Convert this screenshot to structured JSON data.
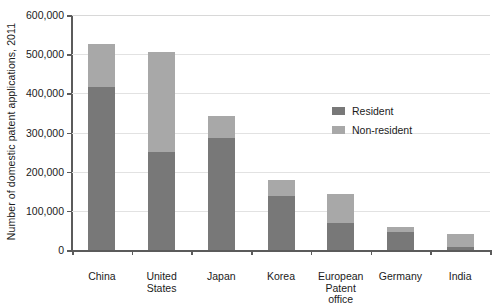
{
  "chart_data": {
    "type": "bar",
    "subtype": "stacked-bar",
    "title": "",
    "xlabel": "",
    "ylabel": "Number of domestic patent applications, 2011",
    "categories": [
      "China",
      "United\nStates",
      "Japan",
      "Korea",
      "European\nPatent\noffice",
      "Germany",
      "India"
    ],
    "series": [
      {
        "name": "Resident",
        "color": "#787878",
        "values": [
          415000,
          250000,
          287000,
          138000,
          70000,
          45000,
          8000
        ]
      },
      {
        "name": "Non-resident",
        "color": "#a8a8a8",
        "values": [
          112000,
          255000,
          55000,
          41000,
          72000,
          15000,
          32000
        ]
      }
    ],
    "totals": [
      527000,
      505000,
      342000,
      179000,
      142000,
      60000,
      40000
    ],
    "ylim": [
      0,
      600000
    ],
    "ytick_values": [
      0,
      100000,
      200000,
      300000,
      400000,
      500000,
      600000
    ],
    "ytick_labels": [
      "0",
      "100,000",
      "200,000",
      "300,000",
      "400,000",
      "500,000",
      "600,000"
    ],
    "grid": true,
    "grid_axis": "y",
    "legend_position": "inside-upper-right",
    "legend_entries": [
      "Resident",
      "Non-resident"
    ]
  },
  "legend": {
    "items": [
      {
        "label": "Resident",
        "color": "#787878"
      },
      {
        "label": "Non-resident",
        "color": "#a8a8a8"
      }
    ]
  },
  "axes": {
    "y_title": "Number of domestic patent applications, 2011"
  }
}
